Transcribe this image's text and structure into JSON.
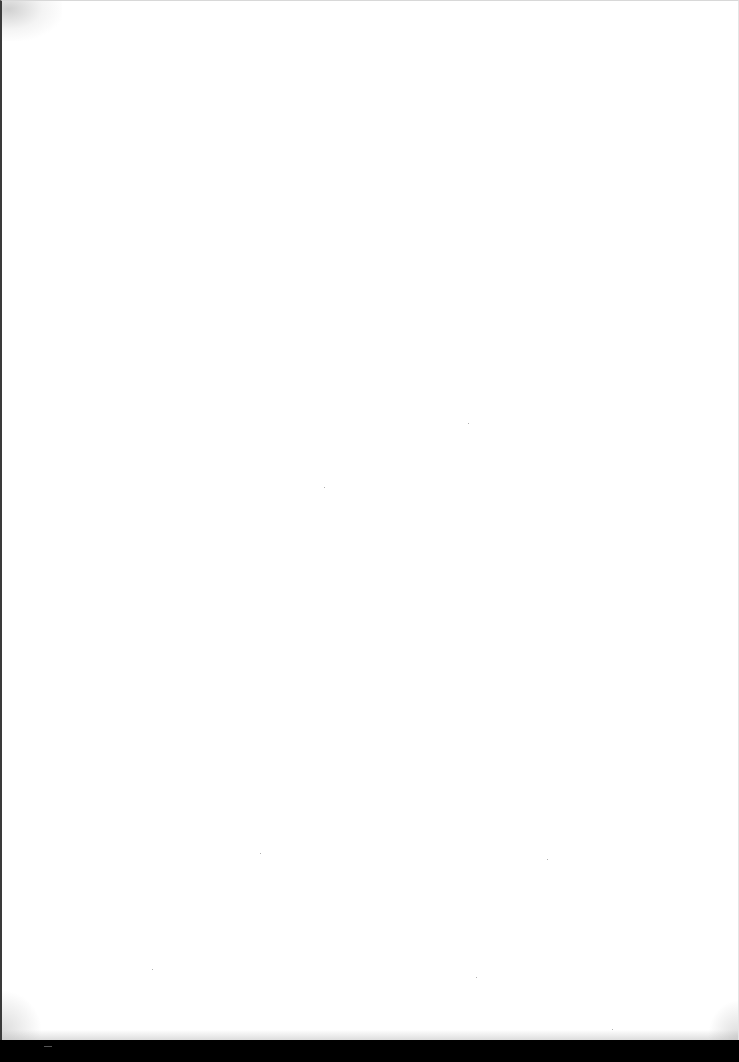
{
  "document": {
    "type": "scanned-page",
    "content": "",
    "page_background": "#ffffff",
    "scanner_background": "#000000"
  }
}
